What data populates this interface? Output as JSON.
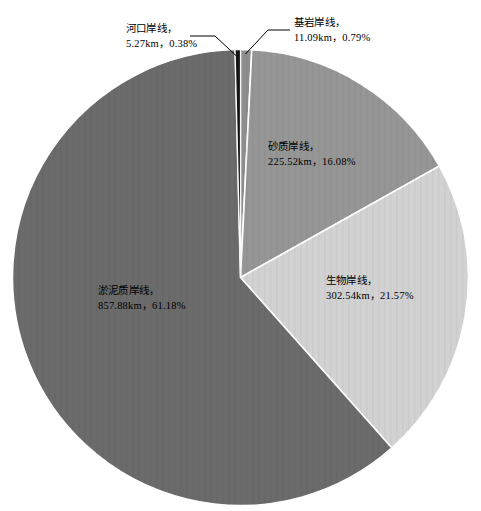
{
  "chart_data": {
    "type": "pie",
    "title": "",
    "subtitle": "",
    "xlabel": "",
    "ylabel": "",
    "legend_position": "none",
    "grid": false,
    "unit": "km",
    "total_km": 1402.3,
    "categories": [
      "基岩岸线",
      "砂质岸线",
      "生物岸线",
      "淤泥质岸线",
      "河口岸线"
    ],
    "values": [
      11.09,
      225.52,
      302.54,
      857.88,
      5.27
    ],
    "percents": [
      0.79,
      16.08,
      21.57,
      61.18,
      0.38
    ],
    "colors": [
      "#8e8e8e",
      "#969696",
      "#d2d2d2",
      "#6b6b6b",
      "#151515"
    ],
    "slices": [
      {
        "name": "基岩岸线",
        "value": 11.09,
        "percent": 0.79,
        "color": "#8e8e8e",
        "label_name": "基岩岸线，",
        "label_value": "11.09km，0.79%"
      },
      {
        "name": "砂质岸线",
        "value": 225.52,
        "percent": 16.08,
        "color": "#969696",
        "label_name": "砂质岸线，",
        "label_value": "225.52km，16.08%"
      },
      {
        "name": "生物岸线",
        "value": 302.54,
        "percent": 21.57,
        "color": "#d2d2d2",
        "label_name": "生物岸线，",
        "label_value": "302.54km，21.57%"
      },
      {
        "name": "淤泥质岸线",
        "value": 857.88,
        "percent": 61.18,
        "color": "#6b6b6b",
        "label_name": "淤泥质岸线，",
        "label_value": "857.88km，61.18%"
      },
      {
        "name": "河口岸线",
        "value": 5.27,
        "percent": 0.38,
        "color": "#151515",
        "label_name": "河口岸线，",
        "label_value": "5.27km，0.38%"
      }
    ]
  },
  "labels": {
    "estuary": {
      "name": "河口岸线，",
      "value": "5.27km，0.38%"
    },
    "bedrock": {
      "name": "基岩岸线，",
      "value": "11.09km，0.79%"
    },
    "sandy": {
      "name": "砂质岸线，",
      "value": "225.52km，16.08%"
    },
    "biological": {
      "name": "生物岸线，",
      "value": "302.54km，21.57%"
    },
    "muddy": {
      "name": "淤泥质岸线，",
      "value": "857.88km，61.18%"
    }
  }
}
